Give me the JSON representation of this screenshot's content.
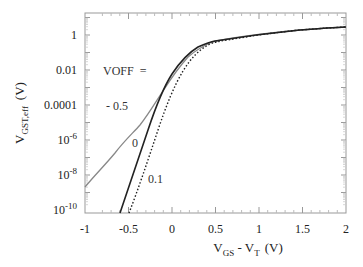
{
  "chart_data": {
    "type": "line",
    "title": "",
    "xlabel": "V_GS - V_T (V)",
    "ylabel": "V_GST,eff (V)",
    "xlim": [
      -1,
      2
    ],
    "ylim": [
      1e-10,
      17
    ],
    "yscale": "log",
    "x_ticks": [
      "-1",
      "-0.5",
      "0",
      "0.5",
      "1",
      "1.5",
      "2"
    ],
    "y_ticks": [
      "1",
      "0.01",
      "0.0001",
      "10^-6",
      "10^-8",
      "10^-10"
    ],
    "grid": false,
    "legend": null,
    "annotations": [
      "VOFF =",
      "- 0.5",
      "0",
      "0.1"
    ],
    "series": [
      {
        "name": "VOFF = -0.5",
        "style": "solid-gray",
        "x": [
          -1.0,
          -0.8,
          -0.6,
          -0.4,
          -0.2,
          0.0,
          0.2,
          0.4,
          0.6,
          1.0,
          1.5,
          2.0
        ],
        "y": [
          2e-09,
          5e-08,
          1e-06,
          1.5e-05,
          0.0003,
          0.005,
          0.07,
          0.35,
          0.6,
          0.9,
          1.3,
          1.7
        ]
      },
      {
        "name": "VOFF = 0",
        "style": "solid-black",
        "x": [
          -0.6,
          -0.4,
          -0.2,
          0.0,
          0.1,
          0.2,
          0.3,
          0.4,
          0.6,
          1.0,
          1.5,
          2.0
        ],
        "y": [
          1e-10,
          5e-08,
          2e-05,
          0.003,
          0.02,
          0.1,
          0.3,
          0.5,
          0.65,
          0.9,
          1.3,
          1.7
        ]
      },
      {
        "name": "VOFF = 0.1",
        "style": "dotted-black",
        "x": [
          -0.5,
          -0.3,
          -0.1,
          0.1,
          0.2,
          0.3,
          0.4,
          0.5,
          0.7,
          1.0,
          1.5,
          2.0
        ],
        "y": [
          1e-10,
          4e-08,
          1.5e-05,
          0.002,
          0.02,
          0.1,
          0.3,
          0.5,
          0.7,
          0.9,
          1.3,
          1.7
        ]
      }
    ]
  },
  "labels": {
    "x_ticks": [
      "-1",
      "-0.5",
      "0",
      "0.5",
      "1",
      "1.5",
      "2"
    ],
    "y_ticks": [
      "1",
      "0.01",
      "0.0001",
      "10",
      "10",
      "10"
    ],
    "y_exps": [
      "-6",
      "-8",
      "-10"
    ],
    "xlabel_main": "V",
    "xlabel_sub1": "GS",
    "xlabel_mid": " - V",
    "xlabel_sub2": "T",
    "xlabel_unit": "(V)",
    "ylabel_main": "V",
    "ylabel_sub": "GST,eff",
    "ylabel_unit": "(V)",
    "voff": "VOFF  =",
    "c1": "- 0.5",
    "c2": "0",
    "c3": "0.1"
  }
}
